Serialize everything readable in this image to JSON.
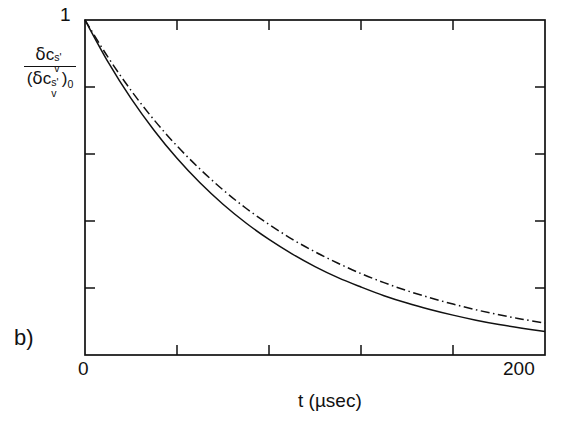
{
  "figure": {
    "panel_label": "b)",
    "background_color": "#ffffff",
    "ink_color": "#111111"
  },
  "chart_data": {
    "type": "line",
    "title": "",
    "subtitle": "",
    "panel": "b)",
    "xlabel": "t (µsec)",
    "ylabel_numerator": "δc_v^{s'}",
    "ylabel_denominator": "(δc_v^{s'})_0",
    "ylabel_plain": "δc_v^{s'} / (δc_v^{s'})_0",
    "xlim": [
      0,
      200
    ],
    "ylim": [
      0,
      1
    ],
    "x_tick_labels": [
      "0",
      "200"
    ],
    "x_labeled_ticks": [
      0,
      200
    ],
    "x_minor_ticks": [
      40,
      80,
      120,
      160
    ],
    "y_tick_labels": [
      "1"
    ],
    "y_labeled_ticks": [
      1
    ],
    "y_minor_ticks": [
      0.2,
      0.4,
      0.6,
      0.8
    ],
    "grid": false,
    "legend": "none",
    "ticks_direction": "inward",
    "frame": "box",
    "series": [
      {
        "name": "solid-curve",
        "style": "solid",
        "color": "#111111",
        "x": [
          0,
          10,
          20,
          30,
          40,
          50,
          60,
          70,
          80,
          90,
          100,
          110,
          120,
          130,
          140,
          150,
          160,
          170,
          180,
          190,
          200
        ],
        "values": [
          1.0,
          0.875,
          0.766,
          0.671,
          0.587,
          0.514,
          0.45,
          0.394,
          0.345,
          0.302,
          0.264,
          0.231,
          0.203,
          0.177,
          0.155,
          0.136,
          0.119,
          0.104,
          0.091,
          0.08,
          0.07
        ]
      },
      {
        "name": "dash-dot-curve",
        "style": "dashdot",
        "color": "#111111",
        "x": [
          0,
          10,
          20,
          30,
          40,
          50,
          60,
          70,
          80,
          90,
          100,
          110,
          120,
          130,
          140,
          150,
          160,
          170,
          180,
          190,
          200
        ],
        "values": [
          1.0,
          0.889,
          0.79,
          0.702,
          0.624,
          0.555,
          0.493,
          0.438,
          0.39,
          0.346,
          0.308,
          0.274,
          0.243,
          0.216,
          0.192,
          0.171,
          0.152,
          0.135,
          0.12,
          0.107,
          0.095
        ]
      }
    ]
  },
  "axes": {
    "y_max_label": "1",
    "x_min_label": "0",
    "x_max_label": "200",
    "x_axis_title": "t (µsec)"
  },
  "ylabel_parts": {
    "delta": "δ",
    "c": "c",
    "sup_s_prime": "s'",
    "sub_v": "v",
    "open_paren": "(",
    "close_paren": ")",
    "sub_zero": "0"
  }
}
